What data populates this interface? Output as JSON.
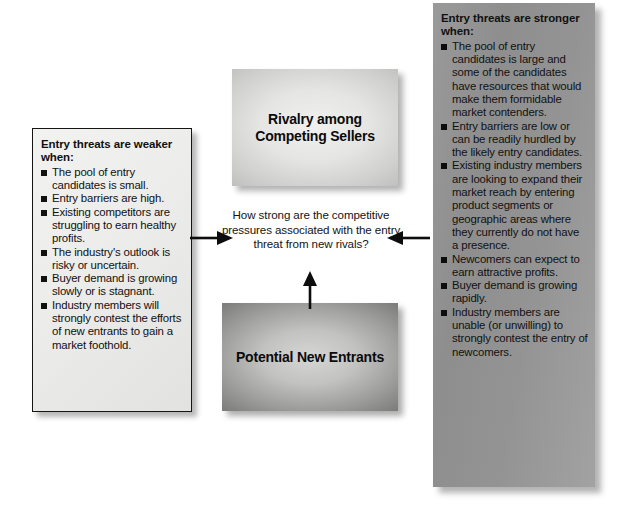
{
  "diagram": {
    "center_question": "How strong are the competitive pressures associated with the entry threat from new rivals?",
    "boxes": {
      "rivalry": "Rivalry among Competing Sellers",
      "entrants": "Potential New Entrants"
    },
    "left_panel": {
      "heading": "Entry threats are weaker when:",
      "bullets": [
        "The pool of entry candidates is small.",
        "Entry barriers are high.",
        "Existing competitors are struggling to earn healthy profits.",
        "The industry's outlook is risky or uncertain.",
        "Buyer demand is growing slowly or is stagnant.",
        "Industry members will strongly contest the efforts of new entrants to gain a market foothold."
      ]
    },
    "right_panel": {
      "heading": "Entry threats are stronger when:",
      "bullets": [
        "The pool of entry candidates is large and some of the candidates have resources that would make them formidable market contenders.",
        "Entry barriers are low or can be readily hurdled by the likely entry candidates.",
        "Existing industry members are looking to expand their market reach by entering product segments or geographic areas where they currently do not have a presence.",
        "Newcomers can expect to earn attractive profits.",
        "Buyer demand is growing rapidly.",
        "Industry members are unable (or unwilling) to strongly contest the entry of newcomers."
      ]
    },
    "arrows": [
      {
        "name": "arrow-left-to-center",
        "direction": "right"
      },
      {
        "name": "arrow-right-to-center",
        "direction": "left"
      },
      {
        "name": "arrow-entrants-to-question",
        "direction": "up"
      }
    ],
    "colors": {
      "panel_light_bg": "#ececeb",
      "panel_dark_bg": "#949494",
      "box_rivalry_bg": "#e5e5e4",
      "box_entrants_bg": "#c2c2c1",
      "text": "#111111",
      "border": "#151515"
    }
  }
}
